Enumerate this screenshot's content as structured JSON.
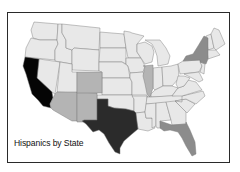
{
  "map": {
    "title": "Hispanics by State",
    "region": "Contiguous United States",
    "legend_visible": false,
    "shading_levels": {
      "highest": "#050505",
      "high": "#2b2b2b",
      "medium": "#8c8c8c",
      "low_medium": "#b4b4b4",
      "base": "#e8e8e8"
    },
    "highlighted_states": [
      {
        "state": "California",
        "level": "highest",
        "color": "#050505"
      },
      {
        "state": "Texas",
        "level": "high",
        "color": "#2b2b2b"
      },
      {
        "state": "New York",
        "level": "medium",
        "color": "#8c8c8c"
      },
      {
        "state": "Florida",
        "level": "medium",
        "color": "#8c8c8c"
      },
      {
        "state": "Arizona",
        "level": "low_medium",
        "color": "#b4b4b4"
      },
      {
        "state": "New Mexico",
        "level": "low_medium",
        "color": "#b4b4b4"
      },
      {
        "state": "Colorado",
        "level": "low_medium",
        "color": "#b4b4b4"
      },
      {
        "state": "Illinois",
        "level": "low_medium",
        "color": "#b4b4b4"
      }
    ],
    "base_color": "#e8e8e8",
    "border_color": "#7a7a7a",
    "frame_color": "#2a2a2a"
  }
}
